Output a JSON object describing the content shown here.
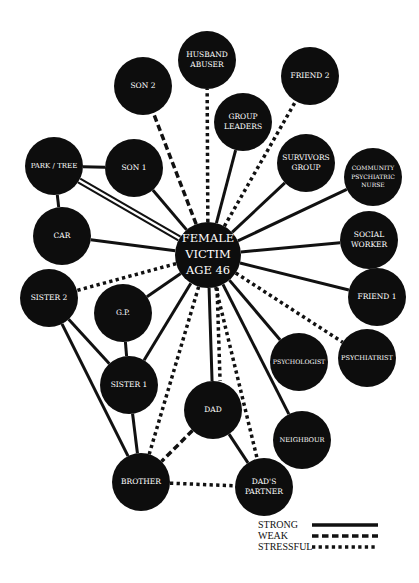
{
  "diagram": {
    "colors": {
      "node": "#0d0d0d",
      "edge": "#111111",
      "text": "#ffffff",
      "background": "#ffffff"
    },
    "center": {
      "id": "victim",
      "lines": [
        "FEMALE",
        "VICTIM",
        "AGE 46"
      ],
      "x": 208,
      "y": 255,
      "r": 33,
      "font": 11.5
    },
    "nodes": [
      {
        "id": "husband",
        "lines": [
          "HUSBAND",
          "ABUSER"
        ],
        "x": 207,
        "y": 60,
        "r": 29,
        "font": 7.5
      },
      {
        "id": "son2",
        "lines": [
          "SON 2"
        ],
        "x": 143,
        "y": 86,
        "r": 29,
        "font": 7.5
      },
      {
        "id": "friend2",
        "lines": [
          "FRIEND 2"
        ],
        "x": 310,
        "y": 76,
        "r": 29,
        "font": 7.5
      },
      {
        "id": "groupleaders",
        "lines": [
          "GROUP",
          "LEADERS"
        ],
        "x": 243,
        "y": 122,
        "r": 29,
        "font": 7.5
      },
      {
        "id": "parktree",
        "lines": [
          "PARK / TREE"
        ],
        "x": 54,
        "y": 166,
        "r": 29,
        "font": 7
      },
      {
        "id": "son1",
        "lines": [
          "SON 1"
        ],
        "x": 134,
        "y": 168,
        "r": 29,
        "font": 7.5
      },
      {
        "id": "survivors",
        "lines": [
          "SURVIVORS",
          "GROUP"
        ],
        "x": 306,
        "y": 163,
        "r": 29,
        "font": 7.5
      },
      {
        "id": "cpn",
        "lines": [
          "COMMUNITY",
          "PSYCHIATRIC",
          "NURSE"
        ],
        "x": 373,
        "y": 177,
        "r": 29,
        "font": 6
      },
      {
        "id": "car",
        "lines": [
          "CAR"
        ],
        "x": 62,
        "y": 236,
        "r": 29,
        "font": 7.5
      },
      {
        "id": "socialworker",
        "lines": [
          "SOCIAL",
          "WORKER"
        ],
        "x": 369,
        "y": 240,
        "r": 29,
        "font": 7.5
      },
      {
        "id": "sister2",
        "lines": [
          "SISTER 2"
        ],
        "x": 49,
        "y": 298,
        "r": 29,
        "font": 7.5
      },
      {
        "id": "gp",
        "lines": [
          "G.P."
        ],
        "x": 123,
        "y": 313,
        "r": 29,
        "font": 7.5
      },
      {
        "id": "friend1",
        "lines": [
          "FRIEND 1"
        ],
        "x": 377,
        "y": 297,
        "r": 29,
        "font": 7.5
      },
      {
        "id": "psychologist",
        "lines": [
          "PSYCHOLOGIST"
        ],
        "x": 299,
        "y": 362,
        "r": 29,
        "font": 6.2
      },
      {
        "id": "psychiatrist",
        "lines": [
          "PSYCHIATRIST"
        ],
        "x": 367,
        "y": 358,
        "r": 29,
        "font": 6.6
      },
      {
        "id": "sister1",
        "lines": [
          "SISTER 1"
        ],
        "x": 129,
        "y": 385,
        "r": 29,
        "font": 7.5
      },
      {
        "id": "dad",
        "lines": [
          "DAD"
        ],
        "x": 213,
        "y": 410,
        "r": 29,
        "font": 7.5
      },
      {
        "id": "neighbour",
        "lines": [
          "NEIGHBOUR"
        ],
        "x": 302,
        "y": 440,
        "r": 29,
        "font": 6.6
      },
      {
        "id": "brother",
        "lines": [
          "BROTHER"
        ],
        "x": 141,
        "y": 482,
        "r": 29,
        "font": 7.5
      },
      {
        "id": "dadspartner",
        "lines": [
          "DAD'S",
          "PARTNER"
        ],
        "x": 264,
        "y": 487,
        "r": 29,
        "font": 7.5
      }
    ],
    "edges": [
      {
        "from": "victim",
        "to": "husband",
        "type": "stressful"
      },
      {
        "from": "victim",
        "to": "son2",
        "type": "weak"
      },
      {
        "from": "victim",
        "to": "friend2",
        "type": "stressful"
      },
      {
        "from": "victim",
        "to": "groupleaders",
        "type": "strong"
      },
      {
        "from": "victim",
        "to": "parktree",
        "type": "double"
      },
      {
        "from": "victim",
        "to": "son1",
        "type": "strong"
      },
      {
        "from": "victim",
        "to": "survivors",
        "type": "strong"
      },
      {
        "from": "victim",
        "to": "cpn",
        "type": "strong"
      },
      {
        "from": "victim",
        "to": "car",
        "type": "strong"
      },
      {
        "from": "victim",
        "to": "socialworker",
        "type": "strong"
      },
      {
        "from": "victim",
        "to": "sister2",
        "type": "stressful"
      },
      {
        "from": "victim",
        "to": "gp",
        "type": "strong"
      },
      {
        "from": "victim",
        "to": "friend1",
        "type": "strong"
      },
      {
        "from": "victim",
        "to": "psychiatrist",
        "type": "stressful"
      },
      {
        "from": "victim",
        "to": "psychologist",
        "type": "strong"
      },
      {
        "from": "victim",
        "to": "sister1",
        "type": "strong"
      },
      {
        "from": "victim",
        "to": "dad",
        "type": "strong"
      },
      {
        "from": "victim",
        "to": "neighbour",
        "type": "strong"
      },
      {
        "from": "victim",
        "to": "brother",
        "type": "stressful"
      },
      {
        "from": "victim",
        "to": "dadspartner",
        "type": "stressful"
      },
      {
        "from": "victim",
        "to": "dad",
        "type": "stressful",
        "offset": -8
      },
      {
        "from": "parktree",
        "to": "son1",
        "type": "strong"
      },
      {
        "from": "parktree",
        "to": "car",
        "type": "strong"
      },
      {
        "from": "sister2",
        "to": "sister1",
        "type": "strong"
      },
      {
        "from": "sister2",
        "to": "brother",
        "type": "strong"
      },
      {
        "from": "gp",
        "to": "sister1",
        "type": "strong"
      },
      {
        "from": "sister1",
        "to": "brother",
        "type": "strong"
      },
      {
        "from": "dad",
        "to": "brother",
        "type": "weak"
      },
      {
        "from": "dad",
        "to": "dadspartner",
        "type": "strong"
      },
      {
        "from": "brother",
        "to": "dadspartner",
        "type": "stressful"
      }
    ]
  },
  "legend": {
    "items": [
      {
        "label": "STRONG",
        "type": "strong"
      },
      {
        "label": "WEAK",
        "type": "weak"
      },
      {
        "label": "STRESSFUL",
        "type": "stressful"
      }
    ]
  }
}
